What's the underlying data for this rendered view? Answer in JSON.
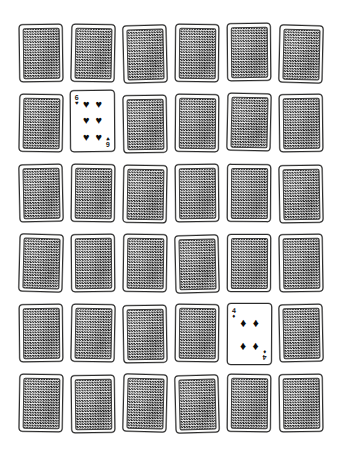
{
  "scene": {
    "title": "Memory Card Game Grid",
    "background_color": "#ffffff",
    "rows": 6,
    "columns": 6,
    "total_cards": 36,
    "face_down_count": 34,
    "face_up_count": 2
  },
  "card_back": {
    "label": "card back",
    "pattern": "checkerboard-lattice",
    "pattern_dark_color": "#1d1d1d",
    "pattern_light_color": "#e8e8e8",
    "border_color": "#2b2b2b",
    "face_color": "#fdfdfc"
  },
  "suits": {
    "hearts": "♥",
    "spades": "♠",
    "diamonds": "♦",
    "clubs": "♣"
  },
  "cards": [
    {
      "id": "r1c1",
      "row": 1,
      "col": 1,
      "state": "face-down",
      "x": 19,
      "y": 24,
      "w": 44,
      "h": 58,
      "rot": -0.8
    },
    {
      "id": "r1c2",
      "row": 1,
      "col": 2,
      "state": "face-down",
      "x": 71,
      "y": 24,
      "w": 44,
      "h": 58,
      "rot": 1.1
    },
    {
      "id": "r1c3",
      "row": 1,
      "col": 3,
      "state": "face-down",
      "x": 123,
      "y": 25,
      "w": 44,
      "h": 58,
      "rot": -1.4
    },
    {
      "id": "r1c4",
      "row": 1,
      "col": 4,
      "state": "face-down",
      "x": 175,
      "y": 24,
      "w": 44,
      "h": 58,
      "rot": 0.6
    },
    {
      "id": "r1c5",
      "row": 1,
      "col": 5,
      "state": "face-down",
      "x": 227,
      "y": 23,
      "w": 44,
      "h": 58,
      "rot": -0.5
    },
    {
      "id": "r1c6",
      "row": 1,
      "col": 6,
      "state": "face-down",
      "x": 279,
      "y": 25,
      "w": 44,
      "h": 58,
      "rot": 1.3
    },
    {
      "id": "r2c1",
      "row": 2,
      "col": 1,
      "state": "face-down",
      "x": 19,
      "y": 94,
      "w": 44,
      "h": 58,
      "rot": 0.9
    },
    {
      "id": "r2c2",
      "row": 2,
      "col": 2,
      "state": "face-up",
      "rank": "6",
      "suit": "hearts",
      "pip_layout": "six",
      "x": 70,
      "y": 90,
      "w": 45,
      "h": 62,
      "rot": -0.4
    },
    {
      "id": "r2c3",
      "row": 2,
      "col": 3,
      "state": "face-down",
      "x": 123,
      "y": 95,
      "w": 44,
      "h": 58,
      "rot": -1.0
    },
    {
      "id": "r2c4",
      "row": 2,
      "col": 4,
      "state": "face-down",
      "x": 175,
      "y": 94,
      "w": 44,
      "h": 58,
      "rot": 0.5
    },
    {
      "id": "r2c5",
      "row": 2,
      "col": 5,
      "state": "face-down",
      "x": 227,
      "y": 93,
      "w": 44,
      "h": 58,
      "rot": 1.2
    },
    {
      "id": "r2c6",
      "row": 2,
      "col": 6,
      "state": "face-down",
      "x": 279,
      "y": 94,
      "w": 44,
      "h": 58,
      "rot": -0.7
    },
    {
      "id": "r3c1",
      "row": 3,
      "col": 1,
      "state": "face-down",
      "x": 19,
      "y": 164,
      "w": 44,
      "h": 58,
      "rot": -1.2
    },
    {
      "id": "r3c2",
      "row": 3,
      "col": 2,
      "state": "face-down",
      "x": 71,
      "y": 164,
      "w": 44,
      "h": 58,
      "rot": 0.7
    },
    {
      "id": "r3c3",
      "row": 3,
      "col": 3,
      "state": "face-down",
      "x": 123,
      "y": 165,
      "w": 44,
      "h": 58,
      "rot": 1.0
    },
    {
      "id": "r3c4",
      "row": 3,
      "col": 4,
      "state": "face-down",
      "x": 175,
      "y": 164,
      "w": 44,
      "h": 58,
      "rot": -0.6
    },
    {
      "id": "r3c5",
      "row": 3,
      "col": 5,
      "state": "face-down",
      "x": 227,
      "y": 164,
      "w": 44,
      "h": 58,
      "rot": 0.4
    },
    {
      "id": "r3c6",
      "row": 3,
      "col": 6,
      "state": "face-down",
      "x": 279,
      "y": 165,
      "w": 44,
      "h": 58,
      "rot": -1.1
    },
    {
      "id": "r4c1",
      "row": 4,
      "col": 1,
      "state": "face-down",
      "x": 19,
      "y": 234,
      "w": 44,
      "h": 58,
      "rot": 1.4
    },
    {
      "id": "r4c2",
      "row": 4,
      "col": 2,
      "state": "face-down",
      "x": 71,
      "y": 234,
      "w": 44,
      "h": 58,
      "rot": -0.5
    },
    {
      "id": "r4c3",
      "row": 4,
      "col": 3,
      "state": "face-down",
      "x": 123,
      "y": 234,
      "w": 44,
      "h": 58,
      "rot": 0.8
    },
    {
      "id": "r4c4",
      "row": 4,
      "col": 4,
      "state": "face-down",
      "x": 175,
      "y": 235,
      "w": 44,
      "h": 58,
      "rot": -1.3
    },
    {
      "id": "r4c5",
      "row": 4,
      "col": 5,
      "state": "face-down",
      "x": 227,
      "y": 234,
      "w": 44,
      "h": 58,
      "rot": 0.3
    },
    {
      "id": "r4c6",
      "row": 4,
      "col": 6,
      "state": "face-down",
      "x": 279,
      "y": 234,
      "w": 44,
      "h": 58,
      "rot": -0.9
    },
    {
      "id": "r5c1",
      "row": 5,
      "col": 1,
      "state": "face-down",
      "x": 19,
      "y": 304,
      "w": 44,
      "h": 58,
      "rot": -0.6
    },
    {
      "id": "r5c2",
      "row": 5,
      "col": 2,
      "state": "face-down",
      "x": 71,
      "y": 304,
      "w": 44,
      "h": 58,
      "rot": 1.1
    },
    {
      "id": "r5c3",
      "row": 5,
      "col": 3,
      "state": "face-down",
      "x": 123,
      "y": 305,
      "w": 44,
      "h": 58,
      "rot": -1.0
    },
    {
      "id": "r5c4",
      "row": 5,
      "col": 4,
      "state": "face-down",
      "x": 175,
      "y": 304,
      "w": 44,
      "h": 58,
      "rot": 0.6
    },
    {
      "id": "r5c5",
      "row": 5,
      "col": 5,
      "state": "face-up",
      "rank": "4",
      "suit": "diamonds",
      "pip_layout": "four",
      "x": 227,
      "y": 303,
      "w": 45,
      "h": 62,
      "rot": 0.3
    },
    {
      "id": "r5c6",
      "row": 5,
      "col": 6,
      "state": "face-down",
      "x": 279,
      "y": 304,
      "w": 44,
      "h": 58,
      "rot": -1.2
    },
    {
      "id": "r6c1",
      "row": 6,
      "col": 1,
      "state": "face-down",
      "x": 19,
      "y": 374,
      "w": 44,
      "h": 58,
      "rot": 0.9
    },
    {
      "id": "r6c2",
      "row": 6,
      "col": 2,
      "state": "face-down",
      "x": 71,
      "y": 375,
      "w": 44,
      "h": 58,
      "rot": -0.7
    },
    {
      "id": "r6c3",
      "row": 6,
      "col": 3,
      "state": "face-down",
      "x": 123,
      "y": 374,
      "w": 44,
      "h": 58,
      "rot": 1.3
    },
    {
      "id": "r6c4",
      "row": 6,
      "col": 4,
      "state": "face-down",
      "x": 175,
      "y": 375,
      "w": 44,
      "h": 58,
      "rot": -1.4
    },
    {
      "id": "r6c5",
      "row": 6,
      "col": 5,
      "state": "face-down",
      "x": 227,
      "y": 374,
      "w": 44,
      "h": 58,
      "rot": 0.5
    },
    {
      "id": "r6c6",
      "row": 6,
      "col": 6,
      "state": "face-down",
      "x": 279,
      "y": 374,
      "w": 44,
      "h": 58,
      "rot": -0.8
    }
  ]
}
